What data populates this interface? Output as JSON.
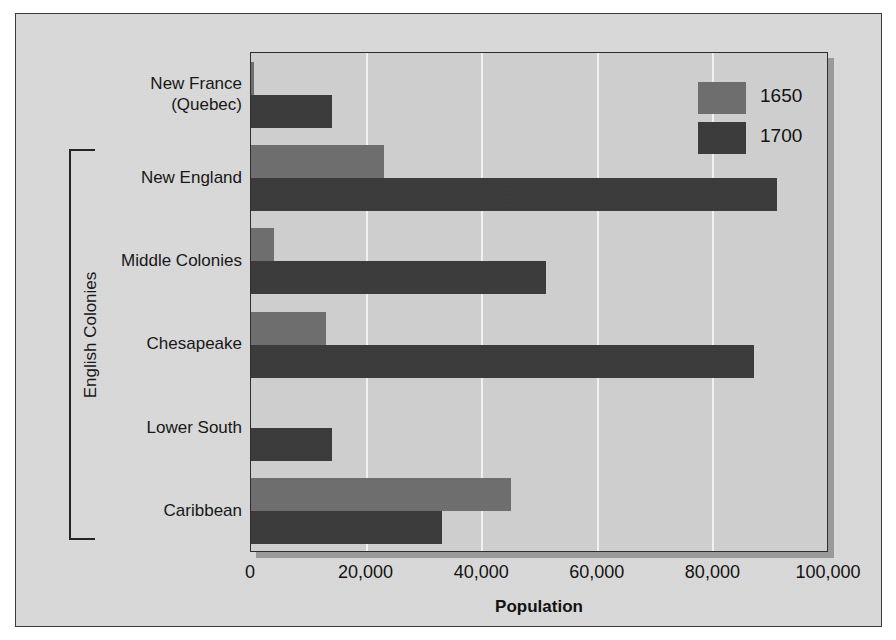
{
  "chart_data": {
    "type": "bar",
    "orientation": "horizontal",
    "title": "",
    "xlabel": "Population",
    "ylabel": "",
    "xlim": [
      0,
      100000
    ],
    "xticks": [
      0,
      20000,
      40000,
      60000,
      80000,
      100000
    ],
    "xtick_labels": [
      "0",
      "20,000",
      "40,000",
      "60,000",
      "80,000",
      "100,000"
    ],
    "grid": true,
    "grid_axis": "x",
    "legend_position": "top-right",
    "categories": [
      "New France\n(Quebec)",
      "New England",
      "Middle Colonies",
      "Chesapeake",
      "Lower South",
      "Caribbean"
    ],
    "series": [
      {
        "name": "1650",
        "color": "#6e6e6e",
        "values": [
          500,
          23000,
          4000,
          13000,
          0,
          45000
        ]
      },
      {
        "name": "1700",
        "color": "#3b3b3b",
        "values": [
          14000,
          91000,
          51000,
          87000,
          14000,
          33000
        ]
      }
    ],
    "annotations": [
      {
        "type": "group-bracket",
        "label": "English Colonies",
        "covers": [
          "New England",
          "Middle Colonies",
          "Chesapeake",
          "Lower South",
          "Caribbean"
        ]
      }
    ]
  },
  "legend": {
    "entries": [
      {
        "label": "1650",
        "color": "#6e6e6e"
      },
      {
        "label": "1700",
        "color": "#3b3b3b"
      }
    ]
  },
  "axis": {
    "x_title": "Population",
    "tick_labels": [
      "0",
      "20,000",
      "40,000",
      "60,000",
      "80,000",
      "100,000"
    ]
  },
  "category_labels": [
    "New France\n(Quebec)",
    "New England",
    "Middle Colonies",
    "Chesapeake",
    "Lower South",
    "Caribbean"
  ],
  "bracket": {
    "label": "English Colonies"
  },
  "colors": {
    "panel_background": "#d9d9d9",
    "plot_background": "#cfcfcf",
    "gridline": "#f2f2f2",
    "border": "#2d2d2d",
    "series_1650": "#6e6e6e",
    "series_1700": "#3b3b3b",
    "text": "#161616"
  }
}
